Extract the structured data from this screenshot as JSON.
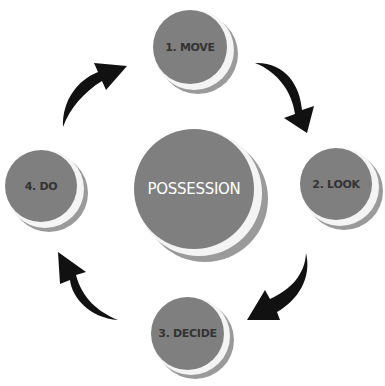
{
  "diagram": {
    "center": {
      "label": "POSSESSION"
    },
    "steps": [
      {
        "label": "1. MOVE"
      },
      {
        "label": "2. LOOK"
      },
      {
        "label": "3. DECIDE"
      },
      {
        "label": "4. DO"
      }
    ],
    "colors": {
      "disc": "#7f7f7f",
      "arrow": "#111111",
      "text_outer": "#333333",
      "text_center": "#ffffff"
    }
  }
}
